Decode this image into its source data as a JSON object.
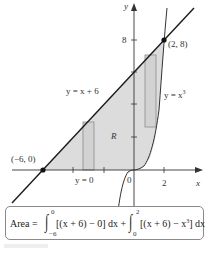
{
  "figure": {
    "axes": {
      "x_label": "x",
      "y_label": "y",
      "x_ticks": [
        {
          "value": 0,
          "label": "0"
        },
        {
          "value": 2,
          "label": "2"
        }
      ],
      "y_ticks": [
        {
          "value": 8,
          "label": "8"
        }
      ]
    },
    "curves": [
      {
        "name": "line",
        "label": "y = x + 6",
        "expr": "x + 6"
      },
      {
        "name": "cubic",
        "label": "y = x",
        "exp": "3",
        "expr": "x^3"
      },
      {
        "name": "x-axis-boundary",
        "label": "y = 0",
        "expr": "0"
      }
    ],
    "points": [
      {
        "label": "(−6, 0)",
        "x": -6,
        "y": 0
      },
      {
        "label": "(2, 8)",
        "x": 2,
        "y": 8
      }
    ],
    "region_label": "R",
    "colors": {
      "region_fill": "#dcdcdc",
      "rect_stroke": "#8c8c8c",
      "line": "#1a1a1a"
    }
  },
  "formula": {
    "prefix": "Area =",
    "int1_upper": "0",
    "int1_lower": "−6",
    "int1_body": "[(x + 6) − 0] dx +",
    "int2_upper": "2",
    "int2_lower": "0",
    "int2_body": "[(x + 6) − x",
    "int2_exp": "3",
    "int2_tail": "] dx"
  }
}
